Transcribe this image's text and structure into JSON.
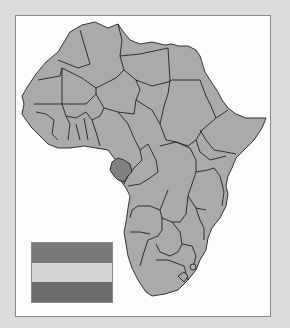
{
  "map": {
    "region": "Africa",
    "highlighted_country": "Gabon",
    "colors": {
      "background": "#dcdcdc",
      "panel": "#fdfdfd",
      "land": "#aaaaaa",
      "highlight": "#808080",
      "border": "#222222"
    }
  },
  "flag": {
    "country": "Gabon",
    "stripes": [
      "#7a7a7a",
      "#d4d4d4",
      "#6c6c6c"
    ]
  }
}
